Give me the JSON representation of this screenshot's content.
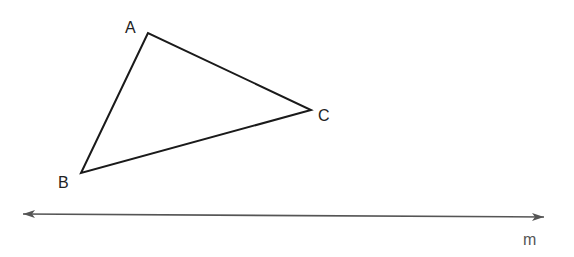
{
  "diagram": {
    "triangle": {
      "vertices": [
        {
          "label": "A",
          "x": 148,
          "y": 33
        },
        {
          "label": "B",
          "x": 81,
          "y": 173
        },
        {
          "label": "C",
          "x": 311,
          "y": 110
        }
      ]
    },
    "line": {
      "label": "m",
      "start": {
        "x": 21,
        "y": 214
      },
      "end": {
        "x": 546,
        "y": 217
      },
      "arrows": "both"
    },
    "colors": {
      "triangle_stroke": "#1a1a1a",
      "line_stroke": "#555555"
    }
  }
}
